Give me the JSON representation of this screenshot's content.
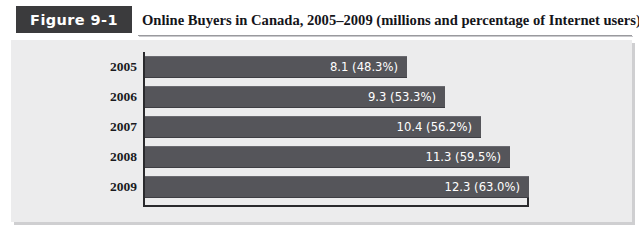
{
  "figure": {
    "badge_label": "Figure 9-1",
    "title": "Online Buyers in Canada, 2005–2009 (millions and percentage of Internet users)"
  },
  "chart_data": {
    "type": "bar",
    "orientation": "horizontal",
    "title": "Online Buyers in Canada, 2005–2009 (millions and percentage of Internet users)",
    "xlabel": "",
    "ylabel": "",
    "grid": false,
    "legend": null,
    "xlim": [
      0,
      13.2
    ],
    "categories": [
      "2005",
      "2006",
      "2007",
      "2008",
      "2009"
    ],
    "values": [
      8.1,
      9.3,
      10.4,
      11.3,
      12.3
    ],
    "percentages": [
      "48.3%",
      "53.3%",
      "56.2%",
      "59.5%",
      "63.0%"
    ],
    "point_labels": [
      "8.1 (48.3%)",
      "9.3 (53.3%)",
      "10.4 (56.2%)",
      "11.3 (59.5%)",
      "12.3 (63.0%)"
    ],
    "bar_color": "#55555a",
    "panel_color": "#ececed",
    "axis_color": "#2a2a2d",
    "label_color": "#ffffff"
  },
  "bars": [
    {
      "year": "2005",
      "label": "8.1 (48.3%)",
      "value": 8.1,
      "width_px": 262
    },
    {
      "year": "2006",
      "label": "9.3 (53.3%)",
      "value": 9.3,
      "width_px": 300
    },
    {
      "year": "2007",
      "label": "10.4 (56.2%)",
      "value": 10.4,
      "width_px": 336
    },
    {
      "year": "2008",
      "label": "11.3 (59.5%)",
      "value": 11.3,
      "width_px": 365
    },
    {
      "year": "2009",
      "label": "12.3 (63.0%)",
      "value": 12.3,
      "width_px": 384
    }
  ]
}
